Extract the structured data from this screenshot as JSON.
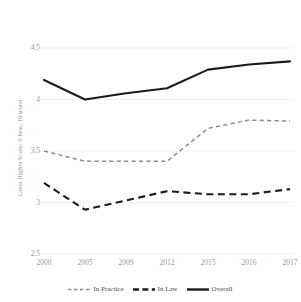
{
  "chart_data": {
    "type": "line",
    "title": "",
    "xlabel": "",
    "ylabel": "Labor Rights Score: 0 best, 10 worst",
    "categories": [
      "2000",
      "2005",
      "2009",
      "2012",
      "2015",
      "2016",
      "2017"
    ],
    "ylim": [
      2.5,
      4.5
    ],
    "yticks": [
      "4.5",
      "4",
      "3.5",
      "3",
      "2.5"
    ],
    "ytick_values": [
      4.5,
      4,
      3.5,
      3,
      2.5
    ],
    "grid": true,
    "grid_axis": "y",
    "legend_position": "bottom",
    "series": [
      {
        "name": "In Practice",
        "style": "dashed",
        "color": "#8d8d8d",
        "values": [
          3.5,
          3.4,
          3.4,
          3.4,
          3.72,
          3.8,
          3.79
        ]
      },
      {
        "name": "In Law",
        "style": "dashed-thick",
        "color": "#1b1b1b",
        "values": [
          3.19,
          2.93,
          3.02,
          3.11,
          3.08,
          3.08,
          3.13
        ]
      },
      {
        "name": "Overall",
        "style": "solid",
        "color": "#1b1b1b",
        "values": [
          4.19,
          4.0,
          4.06,
          4.11,
          4.29,
          4.34,
          4.37
        ]
      }
    ]
  },
  "legend": {
    "items": [
      {
        "label": "In Practice",
        "swatch": "dashed-gray-line-icon"
      },
      {
        "label": "In Law",
        "swatch": "dashed-black-line-icon"
      },
      {
        "label": "Overall",
        "swatch": "solid-black-line-icon"
      }
    ]
  }
}
